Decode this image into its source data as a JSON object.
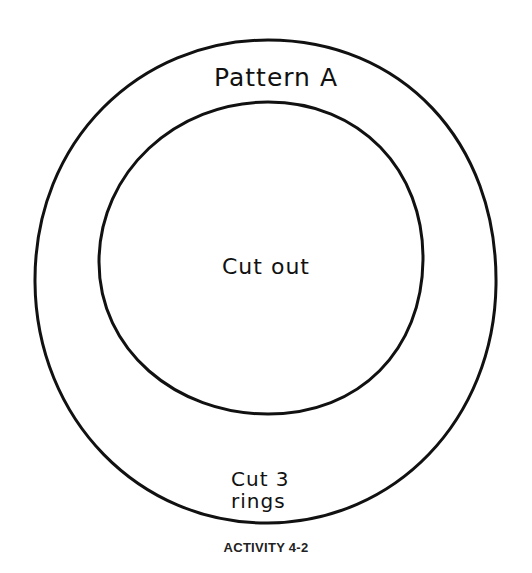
{
  "pattern": {
    "title": "Pattern A",
    "center_label": "Cut out",
    "instruction_line1": "Cut 3",
    "instruction_line2": "rings"
  },
  "caption": "ACTIVITY 4-2",
  "colors": {
    "stroke": "#111111",
    "background": "#ffffff"
  }
}
